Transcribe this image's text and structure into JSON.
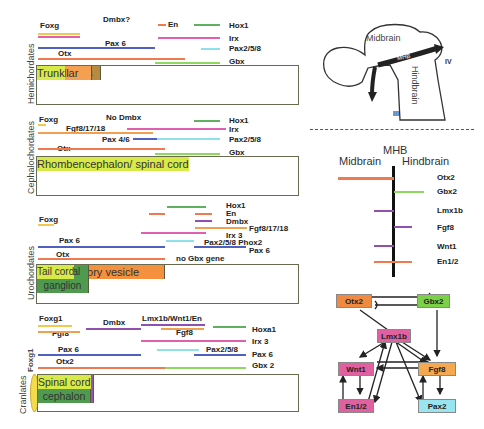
{
  "colors": {
    "foxg": "#f2c94c",
    "pink": "#e060b0",
    "blue": "#5060c0",
    "orange": "#f07a50",
    "green": "#60b060",
    "cyan": "#8ee0ea",
    "lightgreen": "#8fd860",
    "purple": "#9050b0",
    "fgf": "#f0a050"
  },
  "hemichordates": {
    "side_label": "Hemichordates",
    "labels": {
      "foxg": "Foxg",
      "dmbx": "Dmbx?",
      "pax6": "Pax 6",
      "otx": "Otx",
      "en": "En",
      "hox1": "Hox1",
      "irx": "Irx",
      "pax258": "Pax2/5/8",
      "gbx": "Gbx"
    },
    "regions": [
      "Proboscis",
      "Collar",
      "Trunk"
    ]
  },
  "cephalochordates": {
    "side_label": "Cephalochordates",
    "labels": {
      "foxg": "Foxg",
      "nodmbx": "No Dmbx",
      "fgf": "Fgf8/17/18",
      "pax46": "Pax 4/6",
      "otx": "Otx",
      "hox1": "Hox1",
      "irx": "Irx",
      "pax258": "Pax2/5/8",
      "gbx": "Gbx"
    },
    "regions": [
      "Sensory vesicle",
      "Rhombencephalon/ spinal cord"
    ]
  },
  "urochordates": {
    "side_label": "Urochordates",
    "labels": {
      "foxg": "Foxg",
      "pax6": "Pax 6",
      "otx": "Otx",
      "hox1": "Hox1",
      "en": "En",
      "dmbx": "Dmbx",
      "fgf": "Fgf8/17/18",
      "irx3": "Irx 3",
      "pax258": "Pax2/5/8 Phox2",
      "pax6b": "Pax 6",
      "nogbx": "no Gbx gene"
    },
    "regions": [
      "Sensory vesicle",
      "Neck",
      "Visceral ganglion",
      "Tail cord"
    ]
  },
  "craniates": {
    "side_label": "Cranlates",
    "foxg1_vertical": "Foxg1",
    "labels": {
      "foxg1": "Foxg1",
      "fgf8a": "Fgf8",
      "dmbx": "Dmbx",
      "lmx": "Lmx1b/Wnt1/En",
      "fgf8b": "Fgf8",
      "pax6": "Pax 6",
      "otx2": "Otx2",
      "hoxa1": "Hoxa1",
      "irx3": "Irx 3",
      "pax258": "Pax2/5/8",
      "pax6b": "Pax 6",
      "gbx2": "Gbx 2"
    },
    "regions": [
      "Prosen- cephalon",
      "Mesen- cephalon",
      "MHB/ Isthmus",
      "Rhomben- cephalon",
      "Spinal cord"
    ]
  },
  "brain": {
    "midbrain": "Midbrain",
    "mhb": "MHB",
    "hindbrain": "Hindbrain",
    "iii": "III",
    "iv": "IV"
  },
  "mhb_chart": {
    "title": "MHB",
    "left": "Midbrain",
    "right": "Hindbrain",
    "genes": [
      "Otx2",
      "Gbx2",
      "Lmx1b",
      "Fgf8",
      "Wnt1",
      "En1/2"
    ]
  },
  "network": {
    "otx2": "Otx2",
    "gbx2": "Gbx2",
    "lmx1b": "Lmx1b",
    "wnt1": "Wnt1",
    "fgf8": "Fgf8",
    "en12": "En1/2",
    "pax2": "Pax2"
  }
}
